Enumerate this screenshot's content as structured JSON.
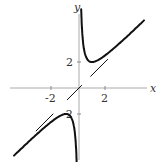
{
  "chart_data": {
    "type": "line",
    "title": "",
    "xlabel": "x",
    "ylabel": "y",
    "xlim": [
      -5.3,
      5.2
    ],
    "ylim": [
      -5.6,
      6.4
    ],
    "grid": false,
    "legend": null,
    "x_ticks": [
      -2,
      2
    ],
    "y_ticks": [
      -2,
      2
    ],
    "x_tick_labels": [
      "-2",
      "2"
    ],
    "y_tick_labels": [
      "-2",
      "2"
    ],
    "series": [
      {
        "name": "y = x + 1/x (x > 0)",
        "style": "solid",
        "x": [
          0.17,
          0.25,
          0.4,
          0.6,
          0.8,
          1.0,
          1.3,
          1.7,
          2.2,
          2.8,
          3.5,
          4.3,
          5.0
        ],
        "y": [
          6.05,
          4.25,
          2.9,
          2.27,
          2.05,
          2.0,
          2.07,
          2.29,
          2.65,
          3.16,
          3.79,
          4.53,
          5.2
        ]
      },
      {
        "name": "y = x + 1/x (x < 0)",
        "style": "solid",
        "x": [
          -5.0,
          -4.3,
          -3.5,
          -2.8,
          -2.2,
          -1.7,
          -1.3,
          -1.0,
          -0.8,
          -0.6,
          -0.4,
          -0.25,
          -0.17
        ],
        "y": [
          -5.2,
          -4.53,
          -3.79,
          -3.16,
          -2.65,
          -2.29,
          -2.07,
          -2.0,
          -2.05,
          -2.27,
          -2.9,
          -4.25,
          -6.05
        ]
      },
      {
        "name": "asymptote y = x (segment 1)",
        "style": "dashed",
        "x": [
          0.9,
          2.2
        ],
        "y": [
          0.9,
          2.2
        ]
      },
      {
        "name": "asymptote y = x (segment 2)",
        "style": "dashed",
        "x": [
          -0.9,
          0.2
        ],
        "y": [
          -0.9,
          0.2
        ]
      },
      {
        "name": "asymptote y = x (segment 3)",
        "style": "dashed",
        "x": [
          -3.3,
          -2.0
        ],
        "y": [
          -3.3,
          -2.0
        ]
      }
    ]
  },
  "labels": {
    "x_axis": "x",
    "y_axis": "y",
    "x_tick_neg": "-2",
    "x_tick_pos": "2",
    "y_tick_pos": "2",
    "y_tick_neg": "-2"
  }
}
